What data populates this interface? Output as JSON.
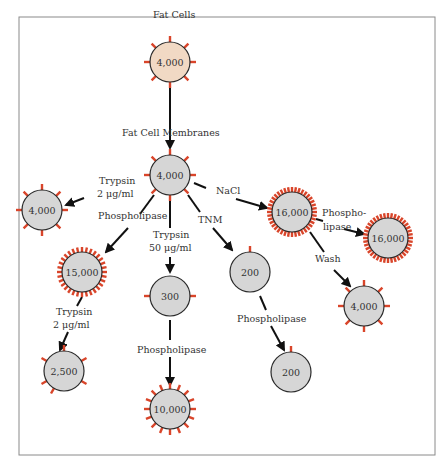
{
  "header": {
    "text": ""
  },
  "diagram": {
    "colors": {
      "fat_cell": "#f1d9c4",
      "membrane": "#d6d6d6",
      "receptor": "#d9452a",
      "arrow": "#111111"
    },
    "nodes": [
      {
        "id": "fat-cells",
        "title": "Fat Cells",
        "value": "4,000",
        "type": "fat"
      },
      {
        "id": "membranes",
        "title": "Fat Cell Membranes",
        "value": "4,000",
        "type": "membrane"
      },
      {
        "id": "trypsin2",
        "value": "4,000"
      },
      {
        "id": "nacl",
        "value": "16,000"
      },
      {
        "id": "nacl-phospho",
        "value": "16,000"
      },
      {
        "id": "phospholipase",
        "value": "15,000"
      },
      {
        "id": "trypsin50",
        "value": "300"
      },
      {
        "id": "tnm",
        "value": "200"
      },
      {
        "id": "wash",
        "value": "4,000"
      },
      {
        "id": "phospho-trypsin",
        "value": "2,500"
      },
      {
        "id": "trypsin50-phospho",
        "value": "10,000"
      },
      {
        "id": "tnm-phospho",
        "value": "200"
      }
    ],
    "labels": {
      "trypsin_a": "Trypsin",
      "trypsin_a2": "2 μg/ml",
      "nacl": "NaCl",
      "phospholipase_a": "Phospholipase",
      "trypsin_b": "Trypsin",
      "trypsin_b2": "50 μg/ml",
      "tnm": "TNM",
      "phospho_split1": "Phospho-",
      "phospho_split2": "lipase",
      "wash": "Wash",
      "trypsin_c": "Trypsin",
      "trypsin_c2": "2 μg/ml",
      "phospholipase_b": "Phospholipase",
      "phospholipase_c": "Phospholipase"
    }
  }
}
